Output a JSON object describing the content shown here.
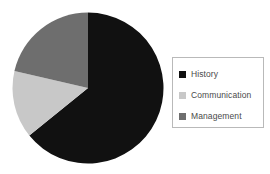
{
  "chart_data": {
    "type": "pie",
    "title": "",
    "xlabel": "",
    "ylabel": "",
    "categories": [
      "History",
      "Communication",
      "Management"
    ],
    "values": [
      64,
      14,
      21
    ],
    "unit": "percent",
    "start_angle_deg": 0,
    "direction": "clockwise",
    "slice_angles_deg": [
      231,
      52,
      77
    ],
    "colors": [
      "#111111",
      "#c8c8c8",
      "#6e6e6e"
    ],
    "legend_position": "right",
    "grid": false,
    "series": [
      {
        "name": "Share",
        "values": [
          64,
          14,
          21
        ]
      }
    ]
  },
  "legend": {
    "items": [
      {
        "label": "History",
        "color": "#111111"
      },
      {
        "label": "Communication",
        "color": "#c8c8c8"
      },
      {
        "label": "Management",
        "color": "#6e6e6e"
      }
    ]
  },
  "colors": {
    "background": "#ffffff",
    "legend_border": "#b9b9b9",
    "legend_text": "#4a4a4a"
  }
}
